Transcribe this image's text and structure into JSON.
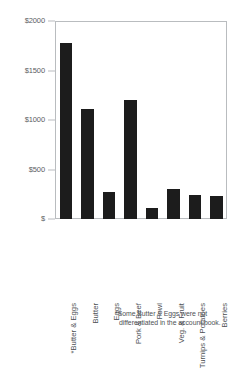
{
  "chart_data": {
    "type": "bar",
    "title": "",
    "subtitle": "",
    "xlabel": "",
    "ylabel": "",
    "categories": [
      "*Butter & Eggs",
      "Butter",
      "Eggs",
      "Pork & Beef",
      "Fowl",
      "Veg. & Fruit",
      "Turnips & Potatoes",
      "Berries"
    ],
    "values": [
      1780,
      1110,
      270,
      1200,
      110,
      300,
      240,
      230
    ],
    "ylim": [
      0,
      2000
    ],
    "ytick_values": [
      0,
      500,
      1000,
      1500,
      2000
    ],
    "ytick_labels": [
      "$",
      "$500",
      "$1000",
      "$1500",
      "$2000"
    ],
    "grid": false,
    "legend": null,
    "bar_color": "#1c1c1c",
    "axis_color": "#b9bcbf",
    "text_color": "#55585c",
    "annotations": [
      "*Some Butter & Eggs were not differentiated in the account book."
    ]
  },
  "footnote": {
    "line1": "*Some Butter & Eggs were not",
    "line2": "differentiated in the account book."
  }
}
